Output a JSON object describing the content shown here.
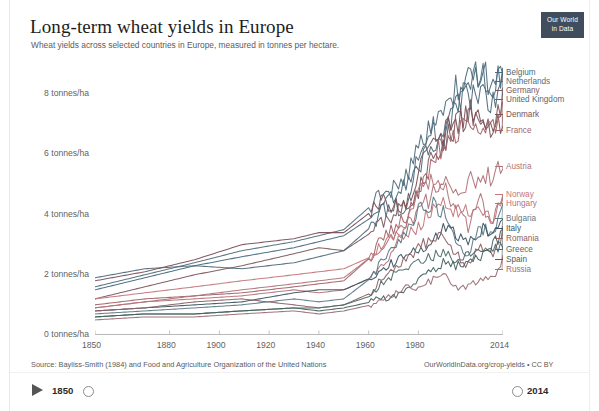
{
  "header": {
    "title": "Long-term wheat yields in Europe",
    "subtitle": "Wheat yields across selected countries in Europe, measured in tonnes per hectare.",
    "logo_line1": "Our World",
    "logo_line2": "in Data"
  },
  "footer": {
    "source": "Source: Bayliss-Smith (1984) and Food and Agriculture Organization of the United Nations",
    "credit": "OurWorldInData.org/crop-yields • CC BY"
  },
  "timeline": {
    "play_label": "play-button",
    "start_year": "1850",
    "end_year": "2014"
  },
  "chart_data": {
    "type": "line",
    "title": "Long-term wheat yields in Europe",
    "subtitle": "Wheat yields across selected countries in Europe, measured in tonnes per hectare.",
    "xlabel": "",
    "ylabel": "tonnes/ha",
    "xlim": [
      1850,
      2014
    ],
    "ylim": [
      0,
      9.2
    ],
    "grid": false,
    "legend_position": "right",
    "y_ticks": [
      0,
      2,
      4,
      6,
      8
    ],
    "y_tick_labels": [
      "0 tonnes/ha",
      "2 tonnes/ha",
      "4 tonnes/ha",
      "6 tonnes/ha",
      "8 tonnes/ha"
    ],
    "x_ticks": [
      1850,
      1880,
      1900,
      1920,
      1940,
      1960,
      1980,
      2014
    ],
    "x_tick_labels": [
      "1850",
      "1880",
      "1900",
      "1920",
      "1940",
      "1960",
      "1980",
      "2014"
    ],
    "x": [
      1850,
      1870,
      1890,
      1909,
      1930,
      1940,
      1950,
      1961,
      1965,
      1970,
      1975,
      1980,
      1985,
      1990,
      1995,
      2000,
      2005,
      2010,
      2014
    ],
    "series": [
      {
        "name": "Belgium",
        "color": "#4a6b80",
        "label_y": 68,
        "values": [
          1.5,
          1.9,
          2.3,
          2.6,
          2.9,
          3.1,
          3.3,
          3.9,
          4.3,
          4.6,
          4.9,
          5.4,
          6.4,
          6.7,
          7.5,
          8.4,
          8.9,
          8.1,
          8.8
        ]
      },
      {
        "name": "Netherlands",
        "color": "#51707f",
        "label_y": 77,
        "values": [
          1.6,
          2.0,
          2.4,
          2.8,
          3.1,
          3.3,
          3.5,
          4.3,
          4.7,
          4.9,
          5.3,
          6.1,
          7.1,
          7.4,
          8.2,
          8.7,
          8.6,
          8.2,
          8.6
        ]
      },
      {
        "name": "Germany",
        "color": "#7d5a60",
        "label_y": 86,
        "values": [
          1.2,
          1.6,
          2.0,
          2.3,
          2.7,
          2.9,
          2.8,
          3.4,
          3.8,
          3.9,
          4.4,
          4.8,
          5.8,
          6.5,
          6.9,
          7.3,
          7.5,
          6.9,
          8.0
        ]
      },
      {
        "name": "United Kingdom",
        "color": "#506b7c",
        "label_y": 95,
        "values": [
          1.9,
          2.2,
          2.3,
          2.2,
          2.4,
          2.6,
          2.8,
          3.6,
          4.1,
          4.2,
          4.3,
          5.9,
          6.9,
          6.5,
          7.7,
          8.0,
          7.9,
          7.7,
          8.6
        ]
      },
      {
        "name": "Denmark",
        "color": "#7a5258",
        "label_y": 110,
        "values": [
          1.8,
          2.1,
          2.5,
          3.0,
          3.2,
          3.4,
          3.4,
          4.1,
          4.4,
          4.3,
          4.2,
          5.3,
          6.3,
          6.7,
          7.0,
          7.2,
          7.1,
          6.6,
          7.3
        ]
      },
      {
        "name": "France",
        "color": "#a3636a",
        "label_y": 126,
        "values": [
          1.0,
          1.2,
          1.3,
          1.4,
          1.6,
          1.7,
          1.8,
          2.6,
          3.2,
          3.5,
          3.9,
          4.7,
          5.7,
          6.4,
          6.6,
          7.3,
          7.0,
          6.9,
          7.4
        ]
      },
      {
        "name": "Austria",
        "color": "#b07378",
        "label_y": 162,
        "values": [
          0.9,
          1.1,
          1.3,
          1.5,
          1.7,
          1.8,
          1.9,
          2.6,
          3.0,
          3.3,
          3.6,
          4.1,
          4.6,
          5.1,
          4.9,
          5.1,
          5.3,
          5.2,
          5.7
        ]
      },
      {
        "name": "Norway",
        "color": "#c2787c",
        "label_y": 190,
        "values": [
          1.2,
          1.4,
          1.6,
          1.8,
          2.0,
          2.1,
          2.2,
          2.6,
          3.0,
          3.3,
          3.4,
          3.6,
          4.2,
          4.4,
          4.1,
          4.1,
          4.4,
          3.6,
          4.6
        ]
      },
      {
        "name": "Hungary",
        "color": "#b4747a",
        "label_y": 199,
        "values": [
          0.9,
          1.1,
          1.2,
          1.3,
          1.5,
          1.4,
          1.5,
          1.9,
          2.3,
          2.8,
          3.6,
          4.8,
          5.1,
          5.0,
          4.2,
          3.6,
          4.5,
          3.7,
          4.6
        ]
      },
      {
        "name": "Bulgaria",
        "color": "#5d7a88",
        "label_y": 214,
        "values": [
          0.7,
          0.8,
          0.9,
          1.0,
          1.2,
          1.1,
          1.2,
          1.9,
          2.4,
          3.0,
          3.4,
          4.1,
          4.4,
          4.1,
          3.2,
          2.6,
          3.6,
          3.3,
          4.3
        ]
      },
      {
        "name": "Italy",
        "color": "#3d5562",
        "label_y": 224,
        "values": [
          0.8,
          0.9,
          1.0,
          1.1,
          1.4,
          1.5,
          1.5,
          1.9,
          2.2,
          2.4,
          2.6,
          2.8,
          3.1,
          3.5,
          3.4,
          3.1,
          3.5,
          3.4,
          3.7
        ]
      },
      {
        "name": "Romania",
        "color": "#8d6266",
        "label_y": 234,
        "values": [
          0.8,
          0.9,
          1.1,
          1.2,
          1.0,
          0.9,
          1.0,
          1.4,
          1.9,
          2.2,
          2.5,
          2.9,
          3.2,
          3.2,
          2.7,
          2.3,
          3.0,
          2.6,
          3.5
        ]
      },
      {
        "name": "Greece",
        "color": "#4f6b6a",
        "label_y": 245,
        "values": [
          0.6,
          0.7,
          0.7,
          0.8,
          0.9,
          0.9,
          1.0,
          1.3,
          1.7,
          2.0,
          2.2,
          2.5,
          2.6,
          2.7,
          2.5,
          2.6,
          2.8,
          2.8,
          3.0
        ]
      },
      {
        "name": "Spain",
        "color": "#46635f",
        "label_y": 255,
        "values": [
          0.6,
          0.7,
          0.7,
          0.8,
          0.9,
          0.8,
          0.9,
          1.1,
          1.2,
          1.3,
          1.5,
          1.8,
          2.1,
          2.4,
          2.3,
          2.5,
          2.6,
          3.0,
          3.4
        ]
      },
      {
        "name": "Russia",
        "color": "#9b6f74",
        "label_y": 265,
        "values": [
          0.5,
          0.6,
          0.6,
          0.7,
          0.8,
          0.7,
          0.8,
          1.0,
          1.1,
          1.4,
          1.6,
          1.6,
          1.8,
          2.1,
          1.6,
          1.6,
          1.9,
          1.9,
          2.5
        ]
      }
    ]
  }
}
